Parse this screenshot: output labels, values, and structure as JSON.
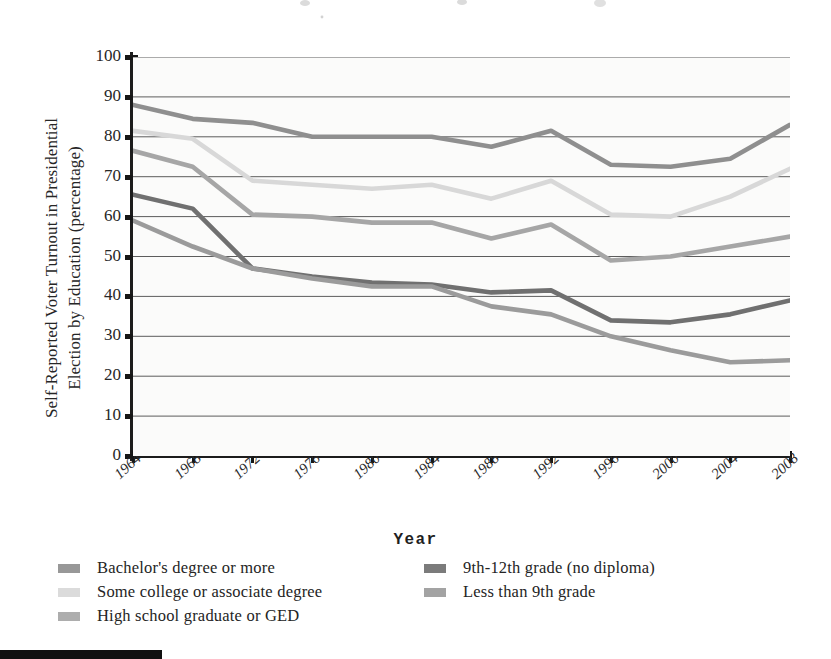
{
  "axes": {
    "y_title": "Self-Reported Voter Turnout in Presidential\nElection by Education (percentage)",
    "x_title": "Year"
  },
  "legend": {
    "left_column": [
      {
        "label": "Bachelor's degree or more",
        "swatch": "bachelors-swatch"
      },
      {
        "label": "Some college or associate degree",
        "swatch": "some-college-swatch"
      },
      {
        "label": "High school graduate or GED",
        "swatch": "high-school-swatch"
      }
    ],
    "right_column": [
      {
        "label": "9th-12th grade (no diploma)",
        "swatch": "ninth-twelfth-swatch"
      },
      {
        "label": "Less than 9th grade",
        "swatch": "less-than-ninth-swatch"
      }
    ]
  },
  "chart_data": {
    "type": "line",
    "title": "",
    "xlabel": "Year",
    "ylabel": "Self-Reported Voter Turnout in Presidential Election by Education (percentage)",
    "categories": [
      "1964",
      "1968",
      "1972",
      "1976",
      "1980",
      "1984",
      "1988",
      "1992",
      "1996",
      "2000",
      "2004",
      "2008"
    ],
    "x": [
      1964,
      1968,
      1972,
      1976,
      1980,
      1984,
      1988,
      1992,
      1996,
      2000,
      2004,
      2008
    ],
    "ylim": [
      0,
      100
    ],
    "ytickstep": 10,
    "yticks": [
      0,
      10,
      20,
      30,
      40,
      50,
      60,
      70,
      80,
      90,
      100
    ],
    "grid": true,
    "legend_position": "bottom",
    "series": [
      {
        "name": "Bachelor's degree or more",
        "color": "#8f8f8f",
        "values": [
          88,
          84.5,
          83.5,
          80,
          80,
          80,
          77.5,
          81.5,
          73,
          72.5,
          74.5,
          83
        ]
      },
      {
        "name": "Some college or associate degree",
        "color": "#d8d8d8",
        "values": [
          81.5,
          79.5,
          69,
          68,
          67,
          68,
          64.5,
          69,
          60.5,
          60,
          65,
          72
        ]
      },
      {
        "name": "High school graduate or GED",
        "color": "#a6a6a6",
        "values": [
          76.5,
          72.5,
          60.5,
          60,
          58.5,
          58.5,
          54.5,
          58,
          49,
          50,
          52.5,
          55
        ]
      },
      {
        "name": "9th-12th grade (no diploma)",
        "color": "#707070",
        "values": [
          65.5,
          62,
          47,
          45,
          43.5,
          43,
          41,
          41.5,
          34,
          33.5,
          35.5,
          39
        ]
      },
      {
        "name": "Less than 9th grade",
        "color": "#9b9b9b",
        "values": [
          59,
          52.5,
          47,
          44.5,
          42.5,
          42.5,
          37.5,
          35.5,
          30,
          26.5,
          23.5,
          24
        ]
      }
    ]
  }
}
